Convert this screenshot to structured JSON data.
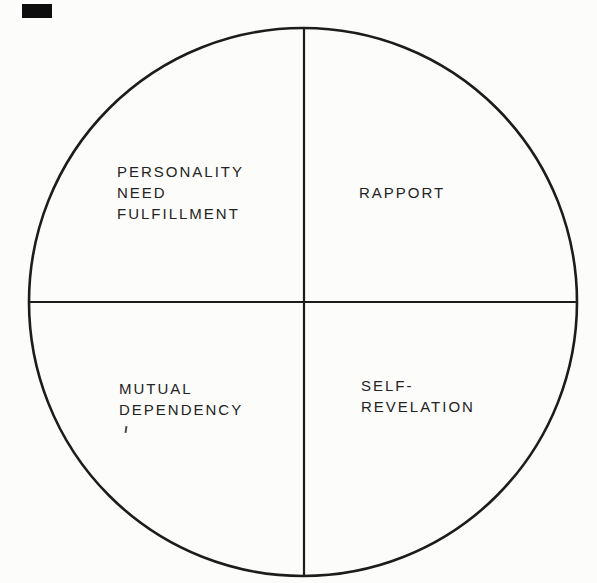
{
  "colors": {
    "ink": "#1c1c1c",
    "paper": "#fcfcfb",
    "artifact_black": "#0e0e0e"
  },
  "diagram": {
    "type": "circle-quadrants",
    "quadrants": [
      {
        "position": "top-left",
        "lines": [
          "PERSONALITY",
          "NEED",
          "FULFILLMENT"
        ]
      },
      {
        "position": "top-right",
        "lines": [
          "RAPPORT"
        ]
      },
      {
        "position": "bottom-left",
        "lines": [
          "MUTUAL",
          "DEPENDENCY"
        ]
      },
      {
        "position": "bottom-right",
        "lines": [
          "SELF-",
          "REVELATION"
        ]
      }
    ]
  }
}
